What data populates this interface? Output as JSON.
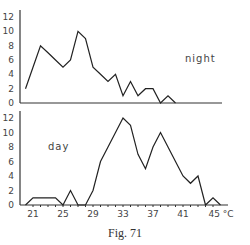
{
  "caption": "Fig. 71",
  "chart_data": [
    {
      "type": "line",
      "title": "night",
      "xlabel": "",
      "ylabel": "",
      "x": [
        20,
        21,
        22,
        23,
        24,
        25,
        26,
        27,
        28,
        29,
        30,
        31,
        32,
        33,
        34,
        35,
        36,
        37,
        38,
        39,
        40
      ],
      "values": [
        2,
        5,
        8,
        7,
        6,
        5,
        6,
        10,
        9,
        5,
        4,
        3,
        4,
        1,
        3,
        1,
        2,
        2,
        0,
        1,
        0
      ],
      "yticks": [
        "0",
        "2",
        "4",
        "6",
        "8",
        "10",
        "12"
      ],
      "ylim": [
        0,
        12
      ],
      "xlim": [
        19,
        46
      ],
      "grid": false
    },
    {
      "type": "line",
      "title": "day",
      "xlabel": "°C",
      "ylabel": "",
      "x": [
        20,
        21,
        22,
        23,
        24,
        25,
        26,
        27,
        28,
        29,
        30,
        31,
        32,
        33,
        34,
        35,
        36,
        37,
        38,
        39,
        40,
        41,
        42,
        43,
        44,
        45,
        46
      ],
      "values": [
        0,
        1,
        1,
        1,
        1,
        0,
        2,
        0,
        0,
        2,
        6,
        8,
        10,
        12,
        11,
        7,
        5,
        8,
        10,
        8,
        6,
        4,
        3,
        4,
        0,
        1,
        0
      ],
      "xticks": [
        "21",
        "25",
        "29",
        "33",
        "37",
        "41",
        "45 °C"
      ],
      "yticks": [
        "0",
        "2",
        "4",
        "6",
        "8",
        "10",
        "12"
      ],
      "ylim": [
        0,
        12
      ],
      "xlim": [
        19,
        46
      ],
      "grid": false
    }
  ]
}
